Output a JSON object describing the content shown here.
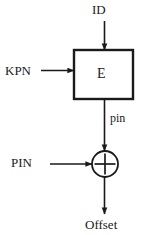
{
  "diagram": {
    "colors": {
      "stroke": "#1a1a1a",
      "background": "#ffffff",
      "text": "#1a1a1a"
    },
    "nodes": [
      {
        "id": "encrypt-block",
        "shape": "rectangle",
        "label": "E",
        "x": 74,
        "y": 50,
        "width": 59,
        "height": 49
      },
      {
        "id": "xor-node",
        "shape": "circle-plus",
        "label": "+",
        "cx": 105,
        "cy": 164,
        "r": 13
      }
    ],
    "labels": {
      "id_input": "ID",
      "kpn_input": "KPN",
      "block_name": "E",
      "intermediate": "pin",
      "pin_input": "PIN",
      "output": "Offset"
    },
    "edges": [
      {
        "id": "id-to-block",
        "from": "ID",
        "to": "E",
        "direction": "down",
        "label": ""
      },
      {
        "id": "kpn-to-block",
        "from": "KPN",
        "to": "E",
        "direction": "right",
        "label": ""
      },
      {
        "id": "block-to-xor",
        "from": "E",
        "to": "xor-node",
        "direction": "down",
        "label": "pin"
      },
      {
        "id": "pin-to-xor",
        "from": "PIN",
        "to": "xor-node",
        "direction": "right",
        "label": ""
      },
      {
        "id": "xor-to-offset",
        "from": "xor-node",
        "to": "Offset",
        "direction": "down",
        "label": ""
      }
    ]
  }
}
